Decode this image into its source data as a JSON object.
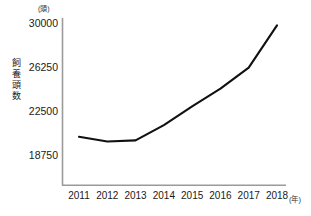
{
  "chart_data": {
    "type": "line",
    "title": "",
    "subtitle": "",
    "xlabel": "年",
    "ylabel": "飼養頭数",
    "yunit": "(頭)",
    "xunit": "(年)",
    "categories": [
      "2011",
      "2012",
      "2013",
      "2014",
      "2015",
      "2016",
      "2017",
      "2018"
    ],
    "values": [
      20300,
      19900,
      20000,
      21300,
      22900,
      24400,
      26200,
      29800
    ],
    "series": [
      {
        "name": "飼養頭数",
        "values": [
          20300,
          19900,
          20000,
          21300,
          22900,
          24400,
          26200,
          29800
        ]
      }
    ],
    "yticks": [
      18750,
      22500,
      26250,
      30000
    ],
    "ytick_labels": [
      "18750",
      "22500",
      "26250",
      "30000"
    ],
    "ylim": [
      15000,
      30000
    ],
    "grid": false,
    "legend": false,
    "legend_position": "none",
    "line_color": "#111111"
  },
  "axes": {
    "y_axis_label_chars": [
      "飼",
      "養",
      "頭",
      "数"
    ],
    "y_unit_label": "(頭)",
    "x_unit_label": "(年)"
  }
}
